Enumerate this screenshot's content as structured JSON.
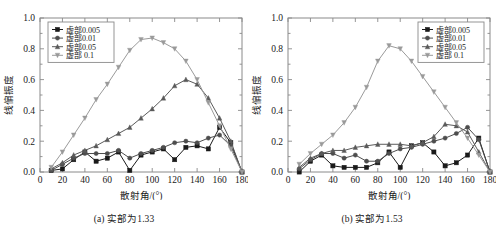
{
  "figure": {
    "panels": [
      {
        "id": "panel-a",
        "caption": "(a) 实部为1.33",
        "xlabel": "散射角/(°)",
        "ylabel": "线偏振度",
        "legend_position": "top-left"
      },
      {
        "id": "panel-b",
        "caption": "(b) 实部为1.53",
        "xlabel": "散射角/(°)",
        "ylabel": "线偏振度",
        "legend_position": "top-right"
      }
    ]
  },
  "chart_data": [
    {
      "type": "line",
      "title": "(a) 实部为1.33",
      "xlabel": "散射角/(°)",
      "ylabel": "线偏振度",
      "xlim": [
        0,
        180
      ],
      "ylim": [
        0.0,
        1.0
      ],
      "xticks": [
        0,
        20,
        40,
        60,
        80,
        100,
        120,
        140,
        160,
        180
      ],
      "yticks": [
        0.0,
        0.2,
        0.4,
        0.6,
        0.8,
        1.0
      ],
      "grid": false,
      "legend_position": "top-left",
      "x": [
        10,
        20,
        30,
        40,
        50,
        60,
        70,
        80,
        90,
        100,
        110,
        120,
        130,
        140,
        150,
        160,
        170,
        180
      ],
      "series": [
        {
          "name": "虚部0.005",
          "marker": "square",
          "color": "#1a1a1a",
          "values": [
            0.01,
            0.02,
            0.08,
            0.13,
            0.07,
            0.09,
            0.13,
            0.01,
            0.11,
            0.13,
            0.15,
            0.08,
            0.16,
            0.17,
            0.15,
            0.29,
            0.19,
            0.0
          ]
        },
        {
          "name": "虚部0.01",
          "marker": "circle",
          "color": "#4d4d4d",
          "values": [
            0.01,
            0.05,
            0.09,
            0.12,
            0.12,
            0.12,
            0.14,
            0.09,
            0.12,
            0.14,
            0.16,
            0.19,
            0.2,
            0.19,
            0.22,
            0.24,
            0.17,
            0.0
          ]
        },
        {
          "name": "虚部0.05",
          "marker": "triangle-up",
          "color": "#5a5a5a",
          "values": [
            0.02,
            0.06,
            0.11,
            0.14,
            0.17,
            0.21,
            0.25,
            0.29,
            0.35,
            0.41,
            0.48,
            0.56,
            0.6,
            0.57,
            0.48,
            0.35,
            0.2,
            0.0
          ]
        },
        {
          "name": "虚部 0.1",
          "marker": "triangle-down",
          "color": "#9a9a9a",
          "values": [
            0.03,
            0.13,
            0.24,
            0.35,
            0.47,
            0.57,
            0.68,
            0.79,
            0.86,
            0.87,
            0.84,
            0.8,
            0.72,
            0.6,
            0.45,
            0.3,
            0.15,
            0.0
          ]
        }
      ]
    },
    {
      "type": "line",
      "title": "(b) 实部为1.53",
      "xlabel": "散射角/(°)",
      "ylabel": "线偏振度",
      "xlim": [
        0,
        180
      ],
      "ylim": [
        0.0,
        1.0
      ],
      "xticks": [
        0,
        20,
        40,
        60,
        80,
        100,
        120,
        140,
        160,
        180
      ],
      "yticks": [
        0.0,
        0.2,
        0.4,
        0.6,
        0.8,
        1.0
      ],
      "grid": false,
      "legend_position": "top-right",
      "x": [
        10,
        20,
        30,
        40,
        50,
        60,
        70,
        80,
        90,
        100,
        110,
        120,
        130,
        140,
        150,
        160,
        170,
        180
      ],
      "series": [
        {
          "name": "虚部0.005",
          "marker": "square",
          "color": "#1a1a1a",
          "values": [
            0.0,
            0.07,
            0.11,
            0.04,
            0.03,
            0.03,
            0.03,
            0.06,
            0.13,
            0.03,
            0.17,
            0.19,
            0.13,
            0.04,
            0.06,
            0.11,
            0.22,
            0.0
          ]
        },
        {
          "name": "虚部0.01",
          "marker": "circle",
          "color": "#4d4d4d",
          "values": [
            0.02,
            0.08,
            0.12,
            0.12,
            0.09,
            0.11,
            0.07,
            0.07,
            0.12,
            0.15,
            0.16,
            0.18,
            0.2,
            0.22,
            0.25,
            0.29,
            0.21,
            0.0
          ]
        },
        {
          "name": "虚部0.05",
          "marker": "triangle-up",
          "color": "#5a5a5a",
          "values": [
            0.03,
            0.09,
            0.12,
            0.14,
            0.14,
            0.16,
            0.17,
            0.18,
            0.18,
            0.18,
            0.17,
            0.19,
            0.23,
            0.31,
            0.3,
            0.26,
            0.13,
            0.0
          ]
        },
        {
          "name": "虚部 0.1",
          "marker": "triangle-down",
          "color": "#9a9a9a",
          "values": [
            0.05,
            0.12,
            0.18,
            0.24,
            0.32,
            0.42,
            0.55,
            0.72,
            0.82,
            0.8,
            0.72,
            0.62,
            0.52,
            0.42,
            0.32,
            0.22,
            0.11,
            0.0
          ]
        }
      ]
    }
  ]
}
